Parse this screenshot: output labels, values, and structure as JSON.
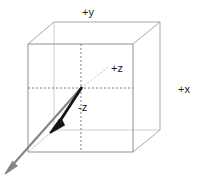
{
  "diagram": {
    "labels": {
      "positive_y": "+y",
      "positive_x": "+x",
      "positive_z": "+z",
      "negative_z": "-z"
    },
    "colors": {
      "background": "#ffffff",
      "cube_edge": "#9a9a9a",
      "cube_edge_front": "#8f8f8f",
      "dashed_axis": "#707070",
      "vector_black": "#111111",
      "vector_gray": "#808080",
      "label_text": "#1a1a1a"
    },
    "geometry": {
      "front_face": {
        "top_left": [
          28,
          44
        ],
        "top_right": [
          133,
          44
        ],
        "bottom_right": [
          133,
          152
        ],
        "bottom_left": [
          28,
          152
        ]
      },
      "back_face": {
        "top_left": [
          54,
          22
        ],
        "top_right": [
          160,
          22
        ],
        "bottom_right": [
          160,
          130
        ],
        "bottom_left": [
          54,
          130
        ]
      },
      "center": [
        81,
        88
      ],
      "dashed_vertical": [
        [
          81,
          44
        ],
        [
          81,
          152
        ]
      ],
      "dashed_horizontal": [
        [
          28,
          88
        ],
        [
          133,
          88
        ]
      ],
      "dashed_z_axis": [
        [
          81,
          88
        ],
        [
          110,
          66
        ]
      ],
      "vector_black": [
        [
          81,
          88
        ],
        [
          52,
          130
        ]
      ],
      "vector_gray": [
        [
          52,
          130
        ],
        [
          6,
          172
        ]
      ]
    }
  }
}
